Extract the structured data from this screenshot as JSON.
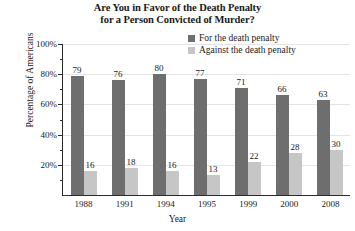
{
  "chart_data": {
    "type": "bar",
    "title": "Are You in Favor of the Death Penalty for a Person Convicted of Murder?",
    "title_lines": [
      "Are You in Favor of the Death Penalty",
      "for a Person Convicted of Murder?"
    ],
    "xlabel": "Year",
    "ylabel": "Percentage of Americans",
    "ylim": [
      0,
      100
    ],
    "ytick_labels": [
      "20%",
      "40%",
      "60%",
      "80%",
      "100%"
    ],
    "ytick_values": [
      20,
      40,
      60,
      80,
      100
    ],
    "grid": true,
    "legend_position": "top-right",
    "categories": [
      "1988",
      "1991",
      "1994",
      "1995",
      "1999",
      "2000",
      "2008"
    ],
    "series": [
      {
        "name": "For the death penalty",
        "color": "#6e6e6e",
        "values": [
          79,
          76,
          80,
          77,
          71,
          66,
          63
        ]
      },
      {
        "name": "Against the death penalty",
        "color": "#c6c6c6",
        "values": [
          16,
          18,
          16,
          13,
          22,
          28,
          30
        ]
      }
    ]
  },
  "legend": {
    "items": [
      {
        "label": "For the death penalty",
        "swatch": "for"
      },
      {
        "label": "Against the death penalty",
        "swatch": "against"
      }
    ]
  }
}
